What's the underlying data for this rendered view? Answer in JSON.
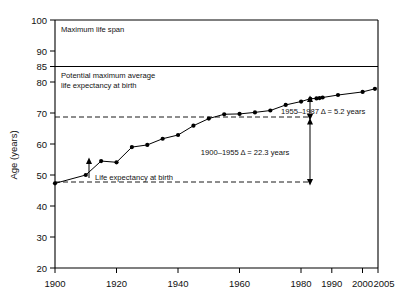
{
  "chart_data": {
    "type": "line",
    "title": "",
    "xlabel": "",
    "ylabel": "Age (years)",
    "xlim": [
      1900,
      2005
    ],
    "ylim": [
      20,
      100
    ],
    "grid": false,
    "legend": "none",
    "x_ticks": [
      1900,
      1920,
      1940,
      1960,
      1980,
      1990,
      2000,
      2005
    ],
    "x_tick_labels": [
      "1900",
      "1920",
      "1940",
      "1960",
      "1980",
      "1990",
      "2000",
      "2005"
    ],
    "y_ticks": [
      20,
      30,
      40,
      50,
      60,
      70,
      80,
      85,
      90,
      100
    ],
    "y_tick_labels": [
      "20",
      "30",
      "40",
      "50",
      "60",
      "70",
      "80",
      "85",
      "90",
      "100"
    ],
    "series": [
      {
        "name": "Life expectancy at birth",
        "x": [
          1900,
          1910,
          1915,
          1920,
          1925,
          1930,
          1935,
          1940,
          1945,
          1950,
          1955,
          1960,
          1965,
          1970,
          1975,
          1980,
          1983,
          1985,
          1986,
          1987,
          1992,
          2000,
          2004
        ],
        "values": [
          47.3,
          50.0,
          54.5,
          54.1,
          59.0,
          59.7,
          61.7,
          62.9,
          65.9,
          68.2,
          69.6,
          69.7,
          70.2,
          70.8,
          72.6,
          73.7,
          74.6,
          74.7,
          74.8,
          75.0,
          75.8,
          76.8,
          77.8
        ]
      }
    ],
    "reference_lines": [
      {
        "id": "maximum-life-span",
        "y": 100,
        "label": "Maximum life span",
        "style": "solid"
      },
      {
        "id": "potential-maximum-average",
        "y": 85,
        "label": "Potential maximum average\nlife expectancy at birth",
        "style": "solid"
      },
      {
        "id": "level-1955",
        "y": 68.2,
        "label": "",
        "style": "dashed"
      },
      {
        "id": "level-1900",
        "y": 47.3,
        "label": "",
        "style": "dashed"
      }
    ],
    "annotations": [
      {
        "id": "max-life-span-label",
        "text": "Maximum life span"
      },
      {
        "id": "potential-max-line1",
        "text": "Potential maximum average"
      },
      {
        "id": "potential-max-line2",
        "text": "life expectancy at birth"
      },
      {
        "id": "life-expectancy-label",
        "text": "Life expectancy at birth"
      },
      {
        "id": "delta-1955-1987",
        "text": "1955–1987  Δ = 5.2 years"
      },
      {
        "id": "delta-1900-1955",
        "text": "1900–1955  Δ = 22.3 years"
      }
    ]
  }
}
